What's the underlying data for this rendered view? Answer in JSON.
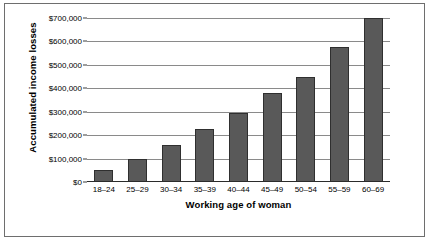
{
  "chart_data": {
    "type": "bar",
    "title": "",
    "subtitle": "",
    "xlabel": "Working age of woman",
    "ylabel": "Accumulated income losses",
    "categories": [
      "18–24",
      "25–29",
      "30–34",
      "35–39",
      "40–44",
      "45–49",
      "50–54",
      "55–59",
      "60–69"
    ],
    "values": [
      50000,
      100000,
      160000,
      225000,
      295000,
      380000,
      450000,
      575000,
      700000
    ],
    "ylim": [
      0,
      700000
    ],
    "ytick_values": [
      0,
      100000,
      200000,
      300000,
      400000,
      500000,
      600000,
      700000
    ],
    "ytick_labels": [
      "$0",
      "$100,000",
      "$200,000",
      "$300,000",
      "$400,000",
      "$500,000",
      "$600,000",
      "$700,000"
    ],
    "grid": true,
    "grid_axis": "y",
    "legend": false,
    "legend_position": "none",
    "bar_color": "#595959",
    "bar_edge_color": "#2f2f2f",
    "grid_color": "#8a8a8a",
    "axis_color": "#2b2b2b",
    "background_color": "#ffffff",
    "frame_color": "#6e6e6e"
  }
}
